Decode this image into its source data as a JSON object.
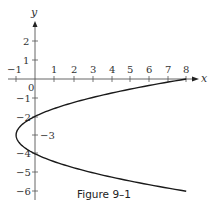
{
  "chart_data": {
    "type": "line",
    "title": "",
    "caption": "Figure 9–1",
    "xlabel": "x",
    "ylabel": "y",
    "xlim": [
      -1,
      8
    ],
    "ylim": [
      -6,
      2
    ],
    "x_ticks": [
      -1,
      1,
      2,
      3,
      4,
      5,
      6,
      7,
      8
    ],
    "y_ticks": [
      2,
      1,
      -1,
      -2,
      -3,
      -4,
      -5,
      -6
    ],
    "origin_label": "0",
    "grid": false,
    "series": [
      {
        "name": "x = (y+3)^2 - 1",
        "description": "Parabola opening right, vertex (-1, -3), y-intercepts -2 and -4, x-intercept 8",
        "points": [
          {
            "x": 8,
            "y": 0
          },
          {
            "x": 3,
            "y": -1
          },
          {
            "x": 0,
            "y": -2
          },
          {
            "x": -1,
            "y": -3
          },
          {
            "x": 0,
            "y": -4
          },
          {
            "x": 3,
            "y": -5
          },
          {
            "x": 8,
            "y": -6
          }
        ]
      }
    ],
    "annotations": [
      {
        "text": "-3",
        "x": 0,
        "y": -3,
        "note": "label beside vertex level on y-axis"
      }
    ]
  },
  "labels": {
    "x_axis": "x",
    "y_axis": "y",
    "origin": "0",
    "caption": "Figure 9–1",
    "xt_m1": "−1",
    "xt_1": "1",
    "xt_2": "2",
    "xt_3": "3",
    "xt_4": "4",
    "xt_5": "5",
    "xt_6": "6",
    "xt_7": "7",
    "xt_8": "8",
    "yt_2": "2",
    "yt_1": "1",
    "yt_m1": "−1",
    "yt_m2": "−2",
    "yt_m3": "−3",
    "yt_m4": "−4",
    "yt_m5": "−5",
    "yt_m6": "−6"
  }
}
